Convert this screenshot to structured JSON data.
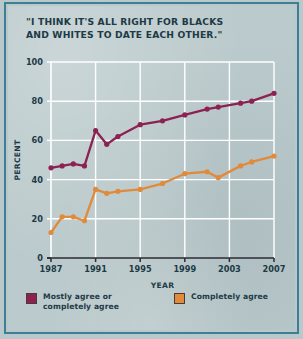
{
  "figure": {
    "title_line1": "\"I THINK IT'S ALL RIGHT FOR BLACKS",
    "title_line2": " AND WHITES TO DATE EACH OTHER.\"",
    "background_color": "#bbcacc",
    "border_color": "#3e7f95"
  },
  "legend": {
    "items": [
      {
        "label_line1": "Mostly agree or",
        "label_line2": "completely agree",
        "color": "#8c2252"
      },
      {
        "label_line1": "Completely agree",
        "label_line2": "",
        "color": "#e08a3c"
      }
    ]
  },
  "chart_data": {
    "type": "line",
    "title": "\"I THINK IT'S ALL RIGHT FOR BLACKS AND WHITES TO DATE EACH OTHER.\"",
    "xlabel": "YEAR",
    "ylabel": "PERCENT",
    "xlim": [
      1987,
      2007
    ],
    "ylim": [
      0,
      100
    ],
    "yticks": [
      0,
      20,
      40,
      60,
      80,
      100
    ],
    "ytick_labels": [
      "0",
      "20",
      "40",
      "60",
      "80",
      "100"
    ],
    "xticks": [
      1987,
      1991,
      1995,
      1999,
      2003,
      2007
    ],
    "xtick_labels": [
      "1987",
      "1991",
      "1995",
      "1999",
      "2003",
      "2007"
    ],
    "grid": true,
    "grid_color": "#ffffff",
    "legend_position": "below",
    "markers": true,
    "x": [
      1987,
      1988,
      1989,
      1990,
      1991,
      1992,
      1993,
      1995,
      1997,
      1999,
      2001,
      2002,
      2004,
      2005,
      2007
    ],
    "series": [
      {
        "name": "Mostly agree or completely agree",
        "color": "#8c2252",
        "values": [
          46,
          47,
          48,
          47,
          65,
          58,
          62,
          68,
          70,
          73,
          76,
          77,
          79,
          80,
          84
        ]
      },
      {
        "name": "Completely agree",
        "color": "#e08a3c",
        "values": [
          13,
          21,
          21,
          19,
          35,
          33,
          34,
          35,
          38,
          43,
          44,
          41,
          47,
          49,
          52
        ]
      }
    ]
  }
}
